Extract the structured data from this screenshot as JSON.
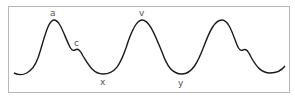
{
  "diagram": {
    "type": "waveform",
    "colors": {
      "curve": "#1a1a1a",
      "frame": "#b8b8b8",
      "label": "#555555"
    },
    "labels": [
      {
        "id": "a",
        "text": "a",
        "feature": "first peak"
      },
      {
        "id": "c",
        "text": "c",
        "feature": "first shoulder"
      },
      {
        "id": "x",
        "text": "x",
        "feature": "first trough"
      },
      {
        "id": "v",
        "text": "v",
        "feature": "second peak"
      },
      {
        "id": "y",
        "text": "y",
        "feature": "second trough"
      }
    ]
  }
}
